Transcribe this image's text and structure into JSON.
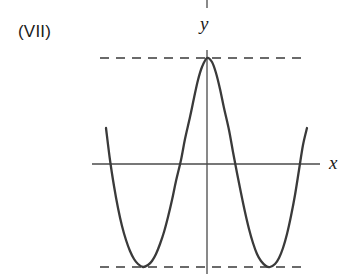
{
  "figure": {
    "case_label": "(VII)",
    "y_axis_label": "y",
    "x_axis_label": "x",
    "stroke_color": "#3a3a3a",
    "axis_color": "#4a4a4a",
    "background_color": "#ffffff"
  },
  "chart_data": {
    "type": "line",
    "title": "(VII)",
    "xlabel": "x",
    "ylabel": "y",
    "grid": false,
    "legend": null,
    "axes": {
      "x_axis_pixel_y": 164,
      "y_axis_pixel_x": 207,
      "x_axis_span_px": [
        92,
        320
      ],
      "y_axis_span_px": [
        50,
        274
      ]
    },
    "annotations": [
      {
        "name": "upper-dashed-line",
        "kind": "horizontal-dashed",
        "label": "local maximum level",
        "pixel_y": 58,
        "pixel_x_start": 100,
        "pixel_x_end": 306
      },
      {
        "name": "lower-dashed-line",
        "kind": "horizontal-dashed",
        "label": "local minimum level",
        "pixel_y": 267,
        "pixel_x_start": 100,
        "pixel_x_end": 306
      }
    ],
    "features": {
      "shape": "quartic W-type curve with central local maximum and two local minima",
      "local_maximum": {
        "x_px": 207,
        "y_px": 58
      },
      "local_minima": [
        {
          "x_px": 143,
          "y_px": 267
        },
        {
          "x_px": 270,
          "y_px": 267
        }
      ],
      "x_intercepts_px": [
        120,
        176,
        239,
        294
      ],
      "curve_endpoints_px": [
        {
          "x_px": 106,
          "y_px": 128
        },
        {
          "x_px": 307,
          "y_px": 128
        }
      ]
    },
    "curve_path_points_px": [
      [
        106,
        128
      ],
      [
        110,
        160
      ],
      [
        114,
        186
      ],
      [
        118,
        208
      ],
      [
        122,
        226
      ],
      [
        126,
        240
      ],
      [
        130,
        251
      ],
      [
        134,
        259
      ],
      [
        138,
        264
      ],
      [
        143,
        267
      ],
      [
        148,
        265
      ],
      [
        152,
        261
      ],
      [
        156,
        254
      ],
      [
        160,
        244
      ],
      [
        164,
        232
      ],
      [
        168,
        217
      ],
      [
        172,
        200
      ],
      [
        176,
        181
      ],
      [
        181,
        160
      ],
      [
        185,
        139
      ],
      [
        190,
        117
      ],
      [
        194,
        98
      ],
      [
        198,
        80
      ],
      [
        202,
        67
      ],
      [
        207,
        58
      ],
      [
        212,
        62
      ],
      [
        216,
        73
      ],
      [
        220,
        89
      ],
      [
        224,
        108
      ],
      [
        229,
        130
      ],
      [
        233,
        152
      ],
      [
        237,
        173
      ],
      [
        241,
        193
      ],
      [
        245,
        212
      ],
      [
        249,
        229
      ],
      [
        253,
        243
      ],
      [
        257,
        254
      ],
      [
        261,
        261
      ],
      [
        266,
        266
      ],
      [
        270,
        267
      ],
      [
        275,
        264
      ],
      [
        279,
        258
      ],
      [
        283,
        248
      ],
      [
        287,
        234
      ],
      [
        291,
        216
      ],
      [
        295,
        195
      ],
      [
        299,
        170
      ],
      [
        303,
        145
      ],
      [
        307,
        128
      ]
    ]
  }
}
